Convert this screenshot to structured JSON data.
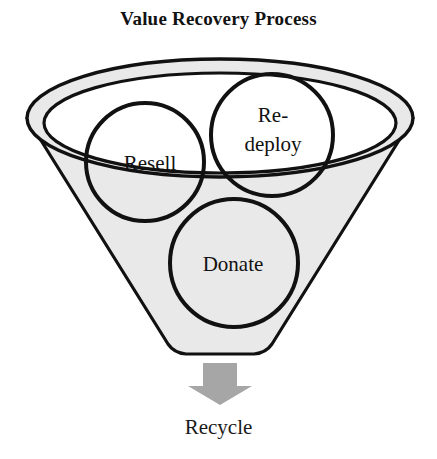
{
  "title": "Value Recovery Process",
  "diagram": {
    "type": "funnel-venn",
    "funnel_name": "value-recovery-funnel",
    "circles": [
      {
        "id": "resell",
        "label": "Resell",
        "cx": 145,
        "cy": 162,
        "r": 59
      },
      {
        "id": "redeploy",
        "label_line1": "Re-",
        "label_line2": "deploy",
        "cx": 272,
        "cy": 135,
        "r": 61
      },
      {
        "id": "donate",
        "label": "Donate",
        "cx": 234,
        "cy": 263,
        "r": 64
      }
    ],
    "output": {
      "arrow_name": "recycle-arrow",
      "label": "Recycle"
    }
  },
  "colors": {
    "funnel_fill": "#e9e9e9",
    "funnel_stroke": "#111111",
    "rim_inner_fill": "#ffffff",
    "arrow_fill": "#a6a6a6",
    "text": "#111111",
    "background": "#ffffff"
  }
}
